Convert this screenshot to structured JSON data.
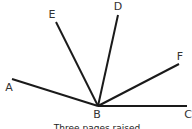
{
  "diagram": {
    "vertex": {
      "label": "B",
      "x": 98,
      "y": 106,
      "label_x": 97,
      "label_y": 118
    },
    "rays": [
      {
        "label": "A",
        "x2": 12,
        "y2": 79,
        "label_x": 9,
        "label_y": 91
      },
      {
        "label": "E",
        "x2": 56,
        "y2": 22,
        "label_x": 52,
        "label_y": 18
      },
      {
        "label": "D",
        "x2": 118,
        "y2": 15,
        "label_x": 118,
        "label_y": 10
      },
      {
        "label": "F",
        "x2": 179,
        "y2": 64,
        "label_x": 180,
        "label_y": 60
      },
      {
        "label": "C",
        "x2": 187,
        "y2": 106,
        "label_x": 187,
        "label_y": 118
      }
    ],
    "line_color": "#1a1a1a",
    "caption": "Three pages raised"
  }
}
